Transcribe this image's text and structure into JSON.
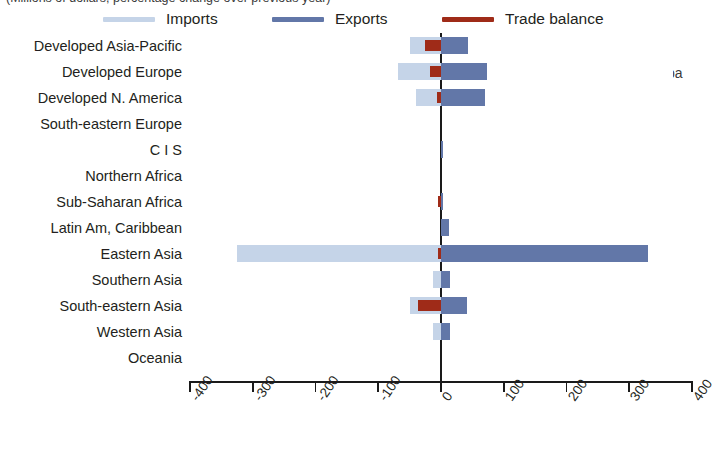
{
  "caption": {
    "clipped_top_line": "(Millions of dollars, percentage change over previous year)",
    "clipped_right_word": "pa"
  },
  "legend": {
    "items": [
      {
        "label": "Imports",
        "color": "#c5d4e8",
        "icon": "legend-swatch-imports"
      },
      {
        "label": "Exports",
        "color": "#6277a8",
        "icon": "legend-swatch-exports"
      },
      {
        "label": "Trade balance",
        "color": "#9f2b18",
        "icon": "legend-swatch-trade-balance"
      }
    ]
  },
  "chart_data": {
    "type": "bar",
    "orientation": "horizontal",
    "title": "",
    "xlabel": "",
    "ylabel": "",
    "xlim": [
      -400,
      400
    ],
    "xticks": [
      -400,
      -300,
      -200,
      -100,
      0,
      100,
      200,
      300,
      400
    ],
    "xtick_labels": [
      "-400",
      "-300",
      "-200",
      "-100",
      "0",
      "100",
      "200",
      "300",
      "400"
    ],
    "grid": false,
    "legend_position": "top",
    "categories": [
      "Developed Asia-Pacific",
      "Developed Europe",
      "Developed N. America",
      "South-eastern Europe",
      "C I S",
      "Northern Africa",
      "Sub-Saharan Africa",
      "Latin Am, Caribbean",
      "Eastern Asia",
      "Southern Asia",
      "South-eastern Asia",
      "Western Asia",
      "Oceania"
    ],
    "series": [
      {
        "name": "Imports",
        "color": "#c5d4e8",
        "values": [
          -49,
          -68,
          -40,
          0,
          0,
          0,
          0,
          0,
          -325,
          -12,
          -50,
          -13,
          0
        ]
      },
      {
        "name": "Exports",
        "color": "#6277a8",
        "values": [
          43,
          73,
          70,
          0,
          2,
          0,
          3,
          12,
          330,
          14,
          42,
          14,
          0
        ]
      },
      {
        "name": "Trade balance",
        "color": "#9f2b18",
        "values": [
          -25,
          -18,
          -6,
          0,
          0,
          0,
          -4,
          0,
          -5,
          0,
          -37,
          0,
          0
        ]
      }
    ]
  }
}
